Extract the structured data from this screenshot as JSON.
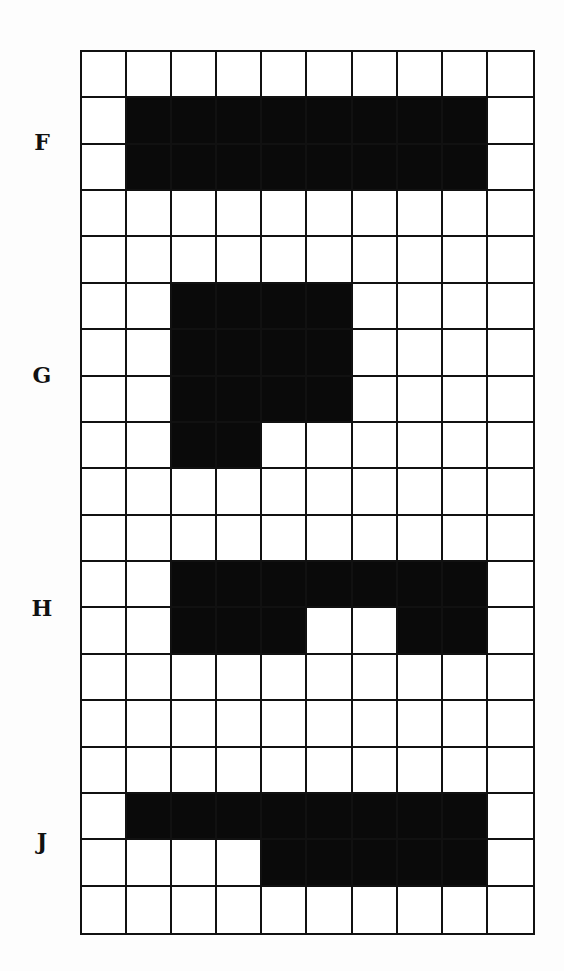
{
  "grid": {
    "columns": 10,
    "rows": 19,
    "cell_fill_color": "#0a0a0a",
    "empty_color": "#ffffff",
    "line_color": "#111111"
  },
  "figures": [
    {
      "label": "F",
      "label_center_row": 2,
      "filled": [
        [
          1,
          [
            1,
            2,
            3,
            4,
            5,
            6,
            7,
            8
          ]
        ],
        [
          2,
          [
            1,
            2,
            3,
            4,
            5,
            6,
            7,
            8
          ]
        ]
      ]
    },
    {
      "label": "G",
      "label_center_row": 7,
      "filled": [
        [
          5,
          [
            2,
            3,
            4,
            5
          ]
        ],
        [
          6,
          [
            2,
            3,
            4,
            5
          ]
        ],
        [
          7,
          [
            2,
            3,
            4,
            5
          ]
        ],
        [
          8,
          [
            2,
            3
          ]
        ]
      ]
    },
    {
      "label": "H",
      "label_center_row": 12,
      "filled": [
        [
          11,
          [
            2,
            3,
            4,
            5,
            6,
            7,
            8
          ]
        ],
        [
          12,
          [
            2,
            3,
            4,
            7,
            8
          ]
        ]
      ]
    },
    {
      "label": "J",
      "label_center_row": 17,
      "filled": [
        [
          16,
          [
            1,
            2,
            3,
            4,
            5,
            6,
            7,
            8
          ]
        ],
        [
          17,
          [
            4,
            5,
            6,
            7,
            8
          ]
        ]
      ]
    }
  ]
}
